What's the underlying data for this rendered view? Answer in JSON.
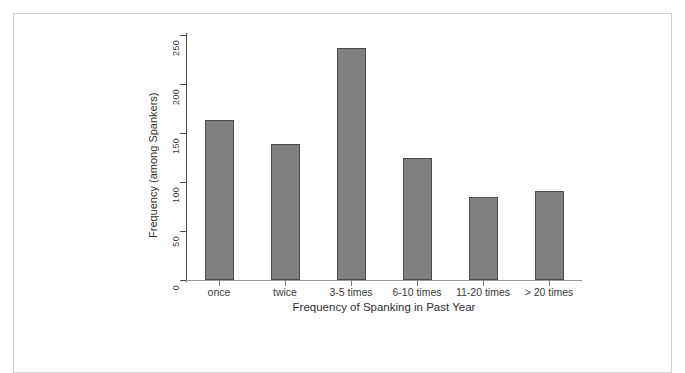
{
  "figure": {
    "name": "bar-chart-spanking-frequency"
  },
  "chart_data": {
    "type": "bar",
    "title": "",
    "subtitle": "",
    "xlabel": "Frequency of Spanking in Past Year",
    "ylabel": "Frequency (among Spankers)",
    "categories": [
      "once",
      "twice",
      "3-5 times",
      "6-10 times",
      "11-20 times",
      "> 20 times"
    ],
    "values": [
      163,
      139,
      237,
      124,
      85,
      91
    ],
    "ylim": [
      0,
      250
    ],
    "yticks": [
      0,
      50,
      100,
      150,
      200,
      250
    ],
    "ytick_labels": [
      "0",
      "50",
      "100",
      "150",
      "200",
      "250"
    ],
    "grid": false,
    "legend": false,
    "legend_position": "none",
    "bar_fill_color": "#808080",
    "bar_border_color": "#4d4d4d",
    "axis_color": "#4a4a4a"
  }
}
